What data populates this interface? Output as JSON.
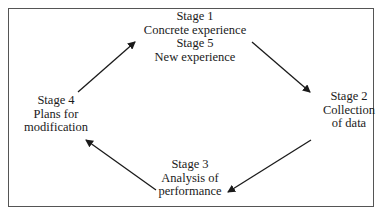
{
  "diagram": {
    "type": "cycle",
    "nodes": [
      {
        "id": "stage1",
        "lines": [
          "Stage 1",
          "Concrete experience",
          "Stage 5",
          "New experience"
        ]
      },
      {
        "id": "stage2",
        "lines": [
          "Stage 2",
          "Collection",
          "of data"
        ]
      },
      {
        "id": "stage3",
        "lines": [
          "Stage 3",
          "Analysis of",
          "performance"
        ]
      },
      {
        "id": "stage4",
        "lines": [
          "Stage 4",
          "Plans for",
          "modification"
        ]
      }
    ],
    "edges": [
      {
        "from": "stage1",
        "to": "stage2"
      },
      {
        "from": "stage2",
        "to": "stage3"
      },
      {
        "from": "stage3",
        "to": "stage4"
      },
      {
        "from": "stage4",
        "to": "stage1"
      }
    ],
    "colors": {
      "line": "#1a1a1a",
      "frame": "#555555",
      "background": "#ffffff"
    }
  }
}
